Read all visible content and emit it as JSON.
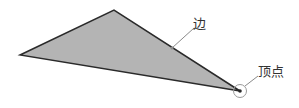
{
  "diagram": {
    "labels": {
      "edge": "边",
      "vertex": "顶点"
    },
    "colors": {
      "fill": "#b4b4b4",
      "stroke": "#2a2a2a",
      "leader": "#8a8a8a"
    }
  }
}
